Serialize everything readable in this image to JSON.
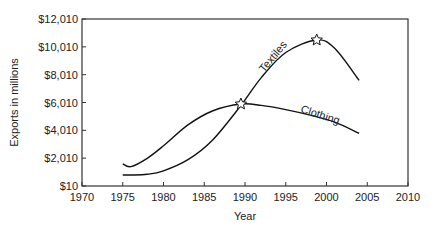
{
  "chart_data": {
    "type": "line",
    "title": "",
    "xlabel": "Year",
    "ylabel": "Exports in millions",
    "xlim": [
      1970,
      2010
    ],
    "ylim": [
      10,
      12010
    ],
    "x_ticks": [
      "1970",
      "1975",
      "1980",
      "1985",
      "1990",
      "1995",
      "2000",
      "2005",
      "2010"
    ],
    "y_ticks": [
      "$10",
      "$2,010",
      "$4,010",
      "$6,010",
      "$8,010",
      "$10,010",
      "$12,010"
    ],
    "grid": false,
    "legend": "inline labels on curves",
    "series": [
      {
        "name": "Textiles",
        "x": [
          1975,
          1976,
          1978,
          1980,
          1983,
          1986,
          1989.5,
          1992,
          1995,
          1998.8,
          2001,
          2004
        ],
        "values": [
          800,
          800,
          850,
          1100,
          1900,
          3300,
          5800,
          7800,
          9600,
          10500,
          9900,
          7600
        ]
      },
      {
        "name": "Clothing",
        "x": [
          1975,
          1976,
          1978,
          1980,
          1983,
          1986,
          1989.5,
          1992,
          1995,
          1998,
          2001,
          2004
        ],
        "values": [
          1600,
          1400,
          2000,
          2900,
          4400,
          5400,
          5900,
          5800,
          5500,
          5100,
          4600,
          3800
        ]
      }
    ],
    "annotations": [
      {
        "type": "star",
        "x": 1989.5,
        "y": 5900,
        "label": "crossover"
      },
      {
        "type": "star",
        "x": 1998.8,
        "y": 10500,
        "label": "Textiles peak"
      }
    ]
  }
}
